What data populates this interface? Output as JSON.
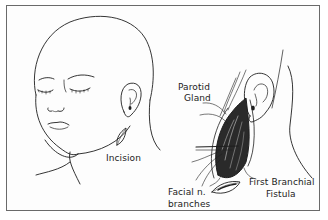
{
  "figure": {
    "panels": [
      {
        "name": "left-panel",
        "subject": "child head, three-quarter view, with incision marked near ear/jaw",
        "labels": [
          {
            "id": "incision",
            "text": "Incision"
          }
        ]
      },
      {
        "name": "right-panel",
        "subject": "surgical dissection view below the ear",
        "labels": [
          {
            "id": "parotid_line1",
            "text": "Parotid"
          },
          {
            "id": "parotid_line2",
            "text": "Gland"
          },
          {
            "id": "facial_line1",
            "text": "Facial n."
          },
          {
            "id": "facial_line2",
            "text": "branches"
          },
          {
            "id": "fistula_line1",
            "text": "First Branchial"
          },
          {
            "id": "fistula_line2",
            "text": "Fistula"
          }
        ]
      }
    ]
  },
  "labels": {
    "incision": "Incision",
    "parotid_1": "Parotid",
    "parotid_2": "Gland",
    "facial_1": "Facial n.",
    "facial_2": "branches",
    "fistula_1": "First Branchial",
    "fistula_2": "Fistula"
  },
  "colors": {
    "line": "#1e1e1e",
    "frame": "#6a6a6a",
    "background": "#ffffff",
    "dark_fill": "#2a2a2a"
  }
}
